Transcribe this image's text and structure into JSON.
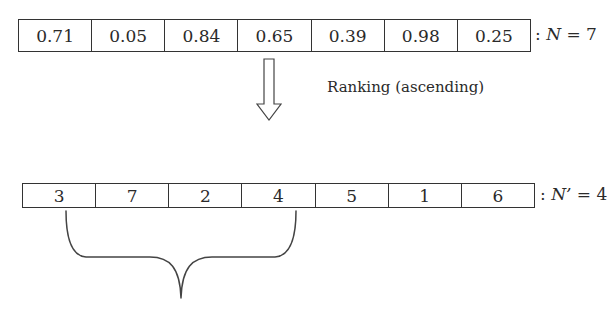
{
  "figure": {
    "input_array": {
      "values": [
        "0.71",
        "0.05",
        "0.84",
        "0.65",
        "0.39",
        "0.98",
        "0.25"
      ],
      "label_prefix": ":",
      "label_var": "N",
      "label_eq": " = 7"
    },
    "transform": {
      "arrow": "hollow-down-arrow",
      "label": "Ranking (ascending)"
    },
    "ranked_array": {
      "values": [
        "3",
        "7",
        "2",
        "4",
        "5",
        "1",
        "6"
      ],
      "label_prefix": ":",
      "label_var": "N’",
      "label_eq": " = 4"
    },
    "selection": {
      "brace": "curly-brace-down",
      "spans_first_n": 4
    },
    "colors": {
      "stroke": "#333333",
      "text": "#2a2a2a",
      "background": "#ffffff"
    }
  }
}
